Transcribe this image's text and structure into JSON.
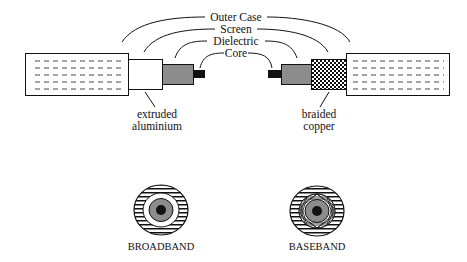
{
  "diagram": {
    "title_labels": {
      "outer_case": "Outer Case",
      "screen": "Screen",
      "dielectric": "Dielectric",
      "core": "Core"
    },
    "left_cable": {
      "annotation_line1": "extruded",
      "annotation_line2": "aluminium"
    },
    "right_cable": {
      "annotation_line1": "braided",
      "annotation_line2": "copper"
    },
    "cross_sections": [
      {
        "label": "BROADBAND"
      },
      {
        "label": "BASEBAND"
      }
    ],
    "colors": {
      "line": "#111111",
      "dielectric": "#8c8c8c",
      "core": "#111111",
      "background": "#ffffff"
    }
  }
}
